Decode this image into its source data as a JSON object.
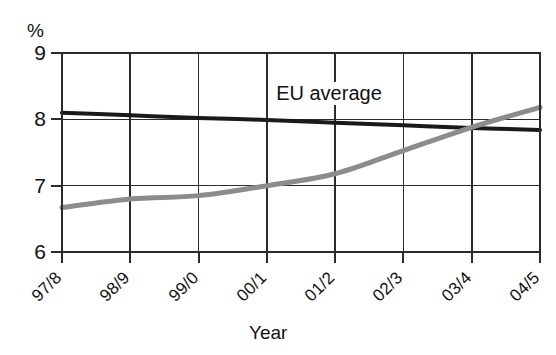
{
  "chart_data": {
    "type": "line",
    "title": "",
    "subtitle": "",
    "xlabel": "Year",
    "ylabel": "%",
    "ylim": [
      6,
      9
    ],
    "yticks": [
      6,
      7,
      8,
      9
    ],
    "ytick_labels": [
      "6",
      "7",
      "8",
      "9"
    ],
    "categories": [
      "97/8",
      "98/9",
      "99/0",
      "00/1",
      "01/2",
      "02/3",
      "03/4",
      "04/5"
    ],
    "grid": "both",
    "legend_position": "inline-annotation",
    "annotations": [
      {
        "text": "EU average",
        "series": "EU average",
        "x": "01/2",
        "y": 8.35
      }
    ],
    "series": [
      {
        "name": "EU average",
        "color": "#1a1a1a",
        "width": 4,
        "values": [
          8.1,
          8.06,
          8.02,
          7.99,
          7.95,
          7.91,
          7.87,
          7.84
        ]
      },
      {
        "name": "National rate",
        "color": "#8c8c8c",
        "width": 5,
        "values": [
          6.67,
          6.8,
          6.85,
          7.0,
          7.18,
          7.53,
          7.88,
          8.18
        ]
      }
    ]
  },
  "axes": {
    "unit_label": "%",
    "x_title": "Year"
  }
}
